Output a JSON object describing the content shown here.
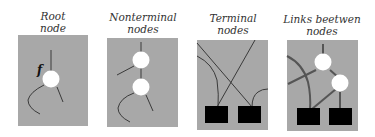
{
  "colors": {
    "panel_fill": "#a8a8a8",
    "line": "#3a3a3a",
    "node_fill": "#ffffff",
    "terminal_fill": "#000000",
    "caption": "#333333"
  },
  "panels": [
    {
      "id": "root",
      "caption_line1": "Root",
      "caption_line2": "node",
      "label": "f"
    },
    {
      "id": "nonterminal",
      "caption_line1": "Nonterminal",
      "caption_line2": "nodes"
    },
    {
      "id": "terminal",
      "caption_line1": "Terminal",
      "caption_line2": "nodes"
    },
    {
      "id": "links",
      "caption_line1": "Links beetwen",
      "caption_line2": "nodes"
    }
  ]
}
